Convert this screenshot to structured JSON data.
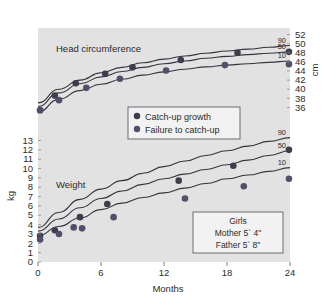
{
  "chart_data": {
    "type": "scatter",
    "title": "",
    "xlabel": "Months",
    "xlim": [
      0,
      24
    ],
    "xticks": [
      0,
      6,
      12,
      18,
      24
    ],
    "xticklabels": [
      "0",
      "6",
      "12",
      "18",
      "24"
    ],
    "grid": false,
    "legend_position": "center",
    "panels": [
      {
        "name": "head-circumference",
        "panel_label": "Head circumference",
        "ylabel": "cm",
        "ylim": [
          35,
          53
        ],
        "yticks": [
          36,
          38,
          40,
          42,
          44,
          46,
          48,
          50,
          52
        ],
        "yticklabels": [
          "36",
          "38",
          "40",
          "42",
          "44",
          "46",
          "48",
          "50",
          "52"
        ],
        "axis_side": "right",
        "percentile_curves": [
          {
            "label": "90",
            "x": [
              0,
              2,
              4,
              6,
              8,
              10,
              12,
              14,
              16,
              18,
              20,
              22,
              24
            ],
            "y": [
              37.0,
              40.0,
              42.0,
              43.6,
              44.8,
              45.8,
              46.6,
              47.3,
              47.9,
              48.4,
              48.8,
              49.2,
              49.6
            ]
          },
          {
            "label": "50",
            "x": [
              0,
              2,
              4,
              6,
              8,
              10,
              12,
              14,
              16,
              18,
              20,
              22,
              24
            ],
            "y": [
              36.2,
              39.2,
              41.2,
              42.7,
              43.9,
              44.8,
              45.6,
              46.2,
              46.8,
              47.2,
              47.6,
              47.9,
              48.2
            ]
          },
          {
            "label": "10",
            "x": [
              0,
              2,
              4,
              6,
              8,
              10,
              12,
              14,
              16,
              18,
              20,
              22,
              24
            ],
            "y": [
              35.0,
              37.8,
              39.7,
              41.1,
              42.2,
              43.1,
              43.8,
              44.4,
              44.9,
              45.3,
              45.6,
              45.9,
              46.2
            ]
          }
        ],
        "series": [
          {
            "name": "Catch-up growth",
            "marker": "filled-circle",
            "color": "#3d3d4e",
            "points": [
              [
                0.2,
                35.4
              ],
              [
                1.6,
                38.6
              ],
              [
                3.6,
                41.3
              ],
              [
                6.4,
                43.4
              ],
              [
                9.0,
                44.8
              ],
              [
                13.6,
                46.4
              ],
              [
                19.0,
                48.0
              ],
              [
                23.9,
                48.2
              ]
            ]
          },
          {
            "name": "Failure to catch-up",
            "marker": "filled-circle",
            "color": "#50506a",
            "points": [
              [
                0.2,
                35.4
              ],
              [
                2.0,
                37.6
              ],
              [
                4.6,
                40.3
              ],
              [
                7.8,
                42.3
              ],
              [
                12.2,
                44.1
              ],
              [
                17.8,
                45.3
              ],
              [
                23.9,
                45.5
              ]
            ]
          }
        ]
      },
      {
        "name": "weight",
        "panel_label": "Weight",
        "ylabel": "kg",
        "ylim": [
          0,
          13.8
        ],
        "yticks": [
          0,
          1,
          2,
          3,
          4,
          5,
          6,
          7,
          8,
          9,
          10,
          11,
          12,
          13
        ],
        "yticklabels": [
          "0",
          "1",
          "2",
          "3",
          "4",
          "5",
          "6",
          "7",
          "8",
          "9",
          "10",
          "11",
          "12",
          "13"
        ],
        "axis_side": "left",
        "percentile_curves": [
          {
            "label": "90",
            "x": [
              0,
              2,
              4,
              6,
              8,
              10,
              12,
              14,
              16,
              18,
              20,
              22,
              24
            ],
            "y": [
              3.7,
              5.3,
              6.7,
              7.8,
              8.7,
              9.5,
              10.2,
              10.8,
              11.4,
              11.9,
              12.4,
              12.9,
              13.3
            ]
          },
          {
            "label": "50",
            "x": [
              0,
              2,
              4,
              6,
              8,
              10,
              12,
              14,
              16,
              18,
              20,
              22,
              24
            ],
            "y": [
              3.3,
              4.6,
              5.8,
              6.8,
              7.6,
              8.3,
              8.9,
              9.4,
              9.9,
              10.4,
              10.9,
              11.4,
              11.9
            ]
          },
          {
            "label": "10",
            "x": [
              0,
              2,
              4,
              6,
              8,
              10,
              12,
              14,
              16,
              18,
              20,
              22,
              24
            ],
            "y": [
              2.8,
              3.8,
              4.7,
              5.6,
              6.3,
              6.9,
              7.4,
              7.9,
              8.4,
              8.9,
              9.3,
              9.7,
              10.1
            ]
          }
        ],
        "series": [
          {
            "name": "Catch-up growth",
            "marker": "filled-circle",
            "color": "#3d3d4e",
            "points": [
              [
                0.2,
                2.8
              ],
              [
                1.6,
                3.4
              ],
              [
                4.0,
                4.8
              ],
              [
                6.6,
                6.2
              ],
              [
                13.4,
                8.7
              ],
              [
                18.6,
                10.3
              ],
              [
                23.9,
                12.0
              ]
            ]
          },
          {
            "name": "Failure to catch-up",
            "marker": "filled-circle",
            "color": "#50506a",
            "points": [
              [
                0.2,
                2.4
              ],
              [
                2.0,
                3.0
              ],
              [
                3.4,
                3.7
              ],
              [
                4.2,
                3.6
              ],
              [
                7.2,
                4.8
              ],
              [
                14.0,
                6.8
              ],
              [
                19.6,
                8.1
              ],
              [
                23.9,
                8.9
              ]
            ]
          }
        ]
      }
    ]
  },
  "axes": {
    "x_axis_title": "Months",
    "x_tick_labels": [
      "0",
      "6",
      "12",
      "18",
      "24"
    ],
    "left_axis_title": "kg",
    "left_tick_labels": [
      "13",
      "12",
      "11",
      "10",
      "9",
      "8",
      "7",
      "6",
      "5",
      "4",
      "3",
      "2",
      "1",
      "0"
    ],
    "right_axis_title": "cm",
    "right_tick_labels": [
      "52",
      "50",
      "48",
      "46",
      "44",
      "42",
      "40",
      "38",
      "36"
    ]
  },
  "panel_labels": {
    "head": "Head circumference",
    "weight": "Weight"
  },
  "percentiles": {
    "head": [
      "90",
      "50",
      "10"
    ],
    "weight": [
      "90",
      "50",
      "10"
    ]
  },
  "legend": {
    "items": [
      {
        "label": "Catch-up growth",
        "marker_color": "#3d3d4e"
      },
      {
        "label": "Failure to catch-up",
        "marker_color": "#50506a"
      }
    ]
  },
  "info_box": {
    "line1": "Girls",
    "line2": "Mother 5` 4\"",
    "line3": "Father 5` 8\""
  },
  "colors": {
    "plot_background": "#e2e2e2",
    "curve": "#35353f",
    "text": "#2b2b2b",
    "box_border": "#6a6a78",
    "box_fill": "#f2f2f2"
  }
}
